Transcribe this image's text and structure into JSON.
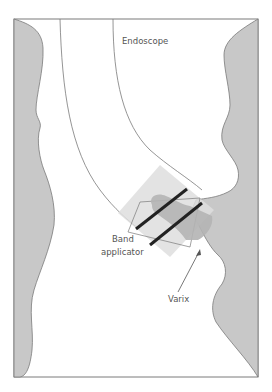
{
  "diagram": {
    "labels": {
      "endoscope": "Endoscope",
      "band_line1": "Band",
      "band_line2": "applicator",
      "varix": "Varix"
    },
    "colors": {
      "wall": "#c8c8c8",
      "wall_stroke": "#7a7a7a",
      "frame": "#7a7a7a",
      "applicator": "#dedede",
      "varix": "#b4b4b4",
      "bands": "#222222",
      "background": "#ffffff"
    }
  }
}
